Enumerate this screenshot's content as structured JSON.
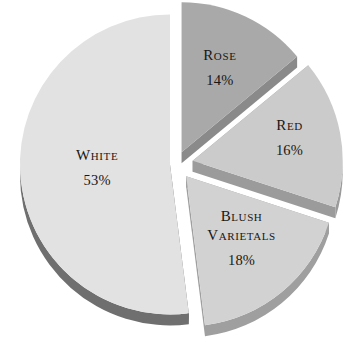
{
  "chart_data": {
    "type": "pie",
    "title": "",
    "subtitle": "",
    "xlabel": "",
    "ylabel": "",
    "legend_position": "none",
    "grid": false,
    "exploded": true,
    "three_d": true,
    "units": "percent",
    "total": 101,
    "categories": [
      "Rose",
      "Red",
      "Blush Varietals",
      "White"
    ],
    "values": [
      14,
      16,
      18,
      53
    ],
    "labels": [
      "14%",
      "16%",
      "18%",
      "53%"
    ],
    "slices": [
      {
        "name": "Rose",
        "display_name": "Rose",
        "value": 14,
        "value_label": "14%",
        "label_lines": [
          "Rose"
        ],
        "fill": "#a9a9a9",
        "side": "#8a8a8a",
        "start_angle": 0,
        "end_angle": 50.4,
        "explode": 13,
        "label_r": 0.6,
        "label_dx": 0,
        "label_dy": -2
      },
      {
        "name": "Red",
        "display_name": "Red",
        "value": 16,
        "value_label": "16%",
        "label_lines": [
          "Red"
        ],
        "fill": "#cbcbcb",
        "side": "#9b9b9b",
        "start_angle": 50.4,
        "end_angle": 108.0,
        "explode": 17,
        "label_r": 0.63,
        "label_dx": 4,
        "label_dy": -4
      },
      {
        "name": "Blush Varietals",
        "display_name": "Blush Varietals",
        "value": 18,
        "value_label": "18%",
        "label_lines": [
          "Blush",
          "Varietals"
        ],
        "fill": "#d2d2d2",
        "side": "#9f9f9f",
        "start_angle": 108.0,
        "end_angle": 172.8,
        "explode": 16,
        "label_r": 0.6,
        "label_dx": -2,
        "label_dy": -6
      },
      {
        "name": "White",
        "display_name": "White",
        "value": 53,
        "value_label": "53%",
        "label_lines": [
          "White"
        ],
        "fill": "#e2e2e2",
        "side": "#6f6f6f",
        "start_angle": 172.8,
        "end_angle": 360.0,
        "explode": 6,
        "label_r": 0.5,
        "label_dx": 2,
        "label_dy": 0
      }
    ],
    "geometry": {
      "cx": 176,
      "cy": 164,
      "rx": 150,
      "ry": 150,
      "depth": 11
    },
    "colors": {
      "background": "#ffffff",
      "text": "#1a1714",
      "rose_fill": "#a9a9a9",
      "red_fill": "#cbcbcb",
      "blush_fill": "#d2d2d2",
      "white_fill": "#e2e2e2"
    }
  }
}
